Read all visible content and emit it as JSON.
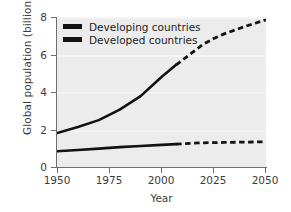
{
  "chart_data": {
    "type": "line",
    "title": "",
    "xlabel": "Year",
    "ylabel": "Global population (billions)",
    "xlim": [
      1950,
      2050
    ],
    "ylim": [
      0,
      8
    ],
    "xticks": [
      1950,
      1975,
      2000,
      2025,
      2050
    ],
    "yticks": [
      0,
      2,
      4,
      6,
      8
    ],
    "grid": "horizontal-bands",
    "legend_position": "top-left",
    "projection_start_year": 2007,
    "series": [
      {
        "name": "Developing countries",
        "color": "#121212",
        "x": [
          1950,
          1960,
          1970,
          1975,
          1980,
          1990,
          2000,
          2007,
          2010,
          2020,
          2025,
          2030,
          2040,
          2050
        ],
        "values": [
          1.81,
          2.13,
          2.5,
          2.78,
          3.06,
          3.78,
          4.8,
          5.45,
          5.7,
          6.55,
          6.85,
          7.1,
          7.5,
          7.85
        ]
      },
      {
        "name": "Developed countries",
        "color": "#121212",
        "x": [
          1950,
          1960,
          1970,
          1975,
          1980,
          1990,
          2000,
          2007,
          2010,
          2020,
          2030,
          2040,
          2050
        ],
        "values": [
          0.84,
          0.91,
          0.98,
          1.02,
          1.06,
          1.12,
          1.18,
          1.22,
          1.24,
          1.29,
          1.31,
          1.33,
          1.34
        ]
      }
    ]
  },
  "axes": {
    "y_tick_labels": [
      "8",
      "6",
      "4",
      "2",
      "0"
    ],
    "x_tick_labels": [
      "1950",
      "1975",
      "2000",
      "2025",
      "2050"
    ],
    "y_title": "Global population (billions)",
    "x_title": "Year"
  },
  "legend": {
    "items": [
      {
        "label": "Developing countries"
      },
      {
        "label": "Developed countries"
      }
    ]
  },
  "colors": {
    "plot_background": "#ececec",
    "gridband": "#f4f4f4",
    "axis": "#6f6f6f",
    "series": "#121212",
    "text": "#3b3b3b",
    "page_background": "#ffffff"
  }
}
